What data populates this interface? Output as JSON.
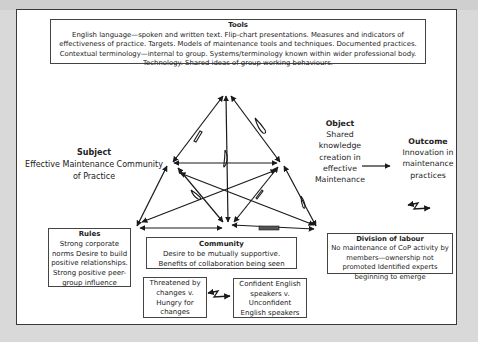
{
  "diagram": {
    "type": "activity-system-triangle",
    "tools": {
      "title": "Tools",
      "text": "English language—spoken and written text. Flip-chart presentations. Measures and indicators of effectiveness of practice. Targets. Models of maintenance tools and techniques. Documented practices. Contextual terminology—internal to group. Systems/terminology known within wider professional body. Technology. Shared ideas of group working behaviours."
    },
    "subject": {
      "title": "Subject",
      "text": "Effective Maintenance Community of Practice"
    },
    "object": {
      "title": "Object",
      "text": "Shared knowledge creation in effective Maintenance"
    },
    "outcome": {
      "title": "Outcome",
      "text": "Innovation in maintenance practices"
    },
    "rules": {
      "title": "Rules",
      "text": "Strong corporate norms Desire to build positive relationships. Strong positive peer-group influence"
    },
    "community": {
      "title": "Community",
      "text": "Desire to be mutually supportive. Benefits of collaboration being seen"
    },
    "division_of_labour": {
      "title": "Division of labour",
      "text": "No maintenance of CoP activity by members—ownership not promoted Identified experts beginning to emerge"
    },
    "tension_1": {
      "text": "Threatened by changes v. Hungry for changes"
    },
    "tension_2": {
      "text": "Confident English speakers v. Unconfident English speakers"
    },
    "legend_symbol": "contradiction-lightning-arrow"
  }
}
